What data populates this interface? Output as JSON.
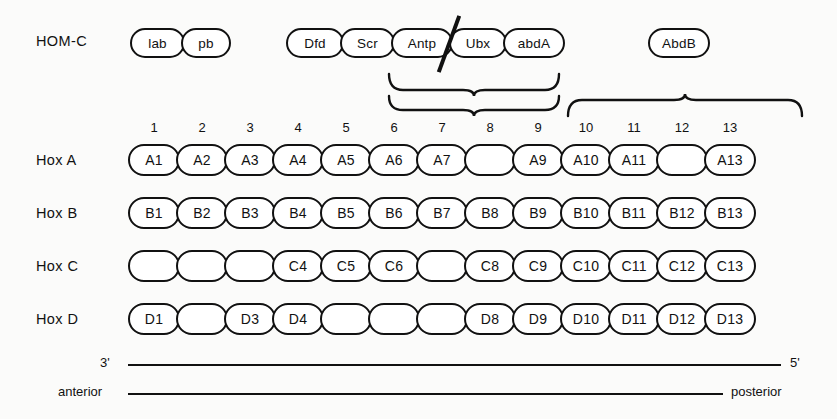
{
  "figure": {
    "rows": [
      {
        "id": "homc",
        "label": "HOM-C"
      },
      {
        "id": "hoxa",
        "label": "Hox A"
      },
      {
        "id": "hoxb",
        "label": "Hox B"
      },
      {
        "id": "hoxc",
        "label": "Hox C"
      },
      {
        "id": "hoxd",
        "label": "Hox D"
      }
    ],
    "homc_groups": [
      {
        "genes": [
          "lab",
          "pb"
        ]
      },
      {
        "genes": [
          "Dfd",
          "Scr",
          "Antp",
          "Ubx",
          "abdA"
        ]
      },
      {
        "genes": [
          "AbdB"
        ]
      }
    ],
    "paralog_numbers": [
      "1",
      "2",
      "3",
      "4",
      "5",
      "6",
      "7",
      "8",
      "9",
      "10",
      "11",
      "12",
      "13"
    ],
    "hox_a": [
      "A1",
      "A2",
      "A3",
      "A4",
      "A5",
      "A6",
      "A7",
      "",
      "A9",
      "A10",
      "A11",
      "",
      "A13"
    ],
    "hox_b": [
      "B1",
      "B2",
      "B3",
      "B4",
      "B5",
      "B6",
      "B7",
      "B8",
      "B9",
      "B10",
      "B11",
      "B12",
      "B13"
    ],
    "hox_c": [
      "",
      "",
      "",
      "C4",
      "C5",
      "C6",
      "",
      "C8",
      "C9",
      "C10",
      "C11",
      "C12",
      "C13"
    ],
    "hox_d": [
      "D1",
      "",
      "D3",
      "D4",
      "",
      "",
      "",
      "D8",
      "D9",
      "D10",
      "D11",
      "D12",
      "D13"
    ],
    "axes": {
      "strand_left": "3'",
      "strand_right": "5'",
      "body_left": "anterior",
      "body_right": "posterior"
    },
    "colors": {
      "stroke": "#111111",
      "background": "#fbfbfa",
      "capsule_fill": "#ffffff"
    }
  }
}
